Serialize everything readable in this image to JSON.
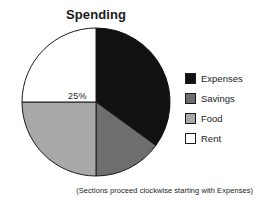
{
  "chart": {
    "title": "Spending",
    "caption": "(Sections proceed clockwise starting with Expenses)",
    "slice_label": "25%"
  },
  "legend": {
    "items": [
      {
        "label": "Expenses",
        "color": "#111111"
      },
      {
        "label": "Savings",
        "color": "#6e6e6e"
      },
      {
        "label": "Food",
        "color": "#a8a8a8"
      },
      {
        "label": "Rent",
        "color": "#ffffff"
      }
    ]
  },
  "chart_data": {
    "type": "pie",
    "title": "Spending",
    "categories": [
      "Expenses",
      "Savings",
      "Food",
      "Rent"
    ],
    "values": [
      35,
      15,
      25,
      25
    ],
    "value_unit": "percent",
    "labels_shown": [
      "",
      "",
      "",
      "25%"
    ],
    "colors": [
      "#111111",
      "#6e6e6e",
      "#a8a8a8",
      "#ffffff"
    ],
    "start_angle_deg": 0,
    "direction": "clockwise",
    "legend_position": "right",
    "grid": false,
    "xlabel": "",
    "ylabel": "",
    "annotation": "(Sections proceed clockwise starting with Expenses)"
  }
}
